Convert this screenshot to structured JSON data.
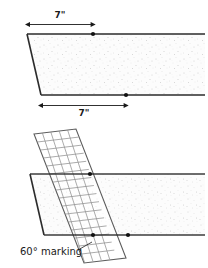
{
  "figure": {
    "width": 208,
    "height": 268,
    "background": "#ffffff",
    "stroke_color": "#1a1a1a",
    "fill_color": "#fbfbfb",
    "speckle_color": "#c9c9c9",
    "ruler_color": "#8a8a8a"
  },
  "top_panel": {
    "name": "top-board-view",
    "dimension_top": {
      "label": "7\"",
      "value": 7,
      "unit": "inch",
      "from_x": 28,
      "to_x": 93,
      "y": 24
    },
    "dimension_bottom": {
      "label": "7\"",
      "value": 7,
      "unit": "inch",
      "from_x": 41,
      "to_x": 126,
      "y": 105
    },
    "board": {
      "top_left_x": 27,
      "top_right_x": 205,
      "top_y": 34,
      "bottom_left_x": 41,
      "bottom_right_x": 205,
      "bottom_y": 95
    },
    "markers": [
      {
        "name": "top-edge-point",
        "x": 93,
        "y": 34
      },
      {
        "name": "bottom-edge-point",
        "x": 126,
        "y": 95
      }
    ]
  },
  "bottom_panel": {
    "name": "bottom-board-view",
    "caption": "60° marking",
    "caption_x": 20,
    "caption_y": 252,
    "angle_degrees": 60,
    "board": {
      "top_left_x": 30,
      "top_right_x": 205,
      "top_y": 174,
      "bottom_left_x": 44,
      "bottom_right_x": 205,
      "bottom_y": 235
    },
    "ruler": {
      "name": "grid-ruler",
      "corner_a_x": 34,
      "corner_a_y": 134,
      "corner_b_x": 76,
      "corner_b_y": 129,
      "corner_c_x": 126,
      "corner_c_y": 258,
      "corner_d_x": 84,
      "corner_d_y": 263,
      "columns": 5,
      "rows": 16
    },
    "markers": [
      {
        "name": "ruler-top-edge-point",
        "x": 90,
        "y": 174
      },
      {
        "name": "ruler-bottom-edge-left-point",
        "x": 93,
        "y": 235
      },
      {
        "name": "ruler-bottom-edge-right-point",
        "x": 128,
        "y": 235
      }
    ]
  }
}
